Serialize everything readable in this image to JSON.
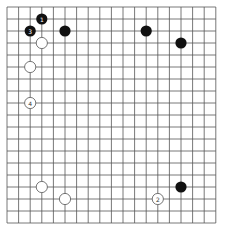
{
  "board": {
    "size": 19,
    "origin_x": 7,
    "origin_y": 7,
    "spacing_x": 11.6,
    "spacing_y": 12,
    "line_color": "#555555",
    "background": "#ffffff"
  },
  "stones": [
    {
      "color": "black",
      "col": 3,
      "row": 1,
      "label": "1"
    },
    {
      "color": "white",
      "col": 13,
      "row": 16,
      "label": "2"
    },
    {
      "color": "black",
      "col": 2,
      "row": 2,
      "label": "3"
    },
    {
      "color": "white",
      "col": 2,
      "row": 8,
      "label": "4"
    },
    {
      "color": "black",
      "col": 5,
      "row": 2,
      "label": ""
    },
    {
      "color": "black",
      "col": 12,
      "row": 2,
      "label": ""
    },
    {
      "color": "black",
      "col": 15,
      "row": 3,
      "label": ""
    },
    {
      "color": "white",
      "col": 3,
      "row": 3,
      "label": ""
    },
    {
      "color": "white",
      "col": 2,
      "row": 5,
      "label": ""
    },
    {
      "color": "white",
      "col": 3,
      "row": 15,
      "label": ""
    },
    {
      "color": "white",
      "col": 5,
      "row": 16,
      "label": ""
    },
    {
      "color": "black",
      "col": 15,
      "row": 15,
      "label": ""
    }
  ],
  "colors": {
    "black_stone": "#111111",
    "white_stone": "#ffffff",
    "white_stone_border": "#555555",
    "black_label": "#ffffff",
    "white_label": "#333333"
  }
}
